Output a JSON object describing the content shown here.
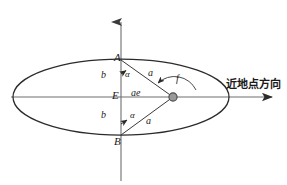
{
  "figure": {
    "type": "orbital-ellipse-geometry-diagram",
    "background_color": "#ffffff",
    "stroke_color": "#2b2b2b",
    "axis_color": "#6e6e6e",
    "focus_fill": "#8c8c8c",
    "width": 287,
    "height": 185
  },
  "labels": {
    "apex_top": "A",
    "apex_bottom": "B",
    "center": "E",
    "semi_minor_top": "b",
    "semi_minor_bottom": "b",
    "angle_top": "α",
    "angle_bottom": "α",
    "semi_major_top": "a",
    "semi_major_bottom": "a",
    "focal_distance": "ae",
    "true_anomaly": "f",
    "direction_text": "近地点方向"
  },
  "geometry": {
    "ellipse_center_x": 121,
    "ellipse_center_y": 97,
    "ellipse_rx": 108,
    "ellipse_ry": 38,
    "focus_x": 173,
    "focus_y": 97,
    "point_a_x": 121,
    "point_a_y": 60,
    "point_b_x": 121,
    "point_b_y": 135,
    "vaxis_top_y": 14,
    "vaxis_bottom_y": 181,
    "haxis_right_x": 283
  }
}
